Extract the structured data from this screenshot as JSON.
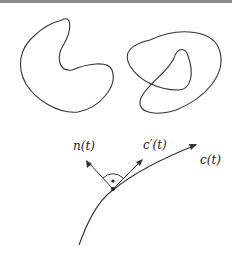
{
  "figure": {
    "panels": [
      {
        "name": "simple-closed-curve",
        "description": "kidney-shaped simple closed curve"
      },
      {
        "name": "self-intersecting-closed-curve",
        "description": "closed curve with one self-intersection"
      },
      {
        "name": "curve-with-frame",
        "description": "curve c(t) with tangent c'(t) and normal n(t) at a point, right angle marked"
      }
    ],
    "labels": {
      "normal": "n(t)",
      "tangent": "c′(t)",
      "curve": "c(t)"
    },
    "colors": {
      "stroke": "#333333",
      "topbar": "#8a8a8a"
    }
  }
}
